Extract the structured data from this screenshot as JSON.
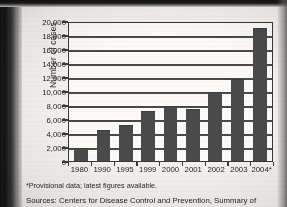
{
  "figure": {
    "footnote": "*Provisional data; latest figures available.",
    "sources": "Sources: Centers for Disease Control and Prevention, Summary of"
  },
  "chart_data": {
    "type": "bar",
    "title": "",
    "xlabel": "",
    "ylabel": "Number of cases",
    "categories": [
      "1980",
      "1990",
      "1995",
      "1999",
      "2000",
      "2001",
      "2002",
      "2003",
      "2004*"
    ],
    "values": [
      1800,
      4500,
      5100,
      7200,
      7900,
      7500,
      9900,
      11700,
      19000
    ],
    "ylim": [
      0,
      20000
    ],
    "ytick_values": [
      0,
      2000,
      4000,
      6000,
      8000,
      10000,
      12000,
      14000,
      16000,
      18000,
      20000
    ],
    "ytick_labels": [
      "0",
      "2,000",
      "4,000",
      "6,000",
      "8,000",
      "10,000",
      "12,000",
      "14,000",
      "16,000",
      "18,000",
      "20,000"
    ],
    "grid": true,
    "grid_axis": "y",
    "legend": false,
    "bar_color": "#4a4a4a",
    "axis_color": "#3a3936",
    "plot_background": "#fbfaf8"
  }
}
